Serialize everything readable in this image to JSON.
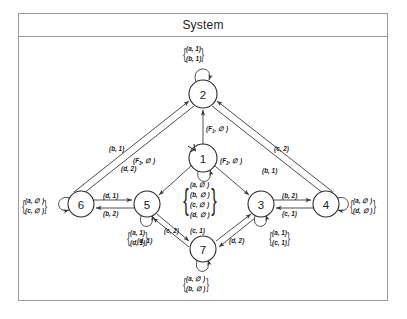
{
  "window": {
    "title": "System"
  },
  "diagram": {
    "type": "state-transition-diagram",
    "nodes": [
      {
        "id": "1",
        "label": "1",
        "x": 203,
        "y": 158,
        "r": 14,
        "initial": true
      },
      {
        "id": "2",
        "label": "2",
        "x": 203,
        "y": 94,
        "r": 14,
        "initial": false
      },
      {
        "id": "3",
        "label": "3",
        "x": 261,
        "y": 204,
        "r": 13,
        "initial": false
      },
      {
        "id": "4",
        "label": "4",
        "x": 326,
        "y": 204,
        "r": 13,
        "initial": false
      },
      {
        "id": "5",
        "label": "5",
        "x": 147,
        "y": 204,
        "r": 13,
        "initial": false
      },
      {
        "id": "6",
        "label": "6",
        "x": 81,
        "y": 204,
        "r": 13,
        "initial": false
      },
      {
        "id": "7",
        "label": "7",
        "x": 203,
        "y": 249,
        "r": 13,
        "initial": false
      }
    ],
    "self_loops": [
      {
        "node": "2",
        "labels": [
          "(a, 1)",
          "(b, 1)"
        ],
        "position": "top"
      },
      {
        "node": "1",
        "labels": [
          "(a, ∅ )",
          "(b, ∅ )",
          "(c, ∅ )",
          "(d, ∅ )"
        ],
        "position": "bottom"
      },
      {
        "node": "6",
        "labels": [
          "(a, ∅ )",
          "(c, ∅ )"
        ],
        "position": "left"
      },
      {
        "node": "5",
        "labels": [
          "(a, 1)",
          "(d, 1)"
        ],
        "position": "bottom"
      },
      {
        "node": "3",
        "labels": [
          "(a, 1)",
          "(c, 1)"
        ],
        "position": "bottom"
      },
      {
        "node": "4",
        "labels": [
          "(a, ∅ )",
          "(d, ∅ )"
        ],
        "position": "right"
      },
      {
        "node": "7",
        "labels": [
          "(a, ∅ )",
          "(b, ∅ )"
        ],
        "position": "bottom"
      }
    ],
    "edges": [
      {
        "from": "1",
        "to": "2",
        "label": "(F",
        "sub": "1",
        "label_tail": ", ∅ )"
      },
      {
        "from": "1",
        "to": "5",
        "label": "(F",
        "sub": "3",
        "label_tail": ", ∅ )"
      },
      {
        "from": "1",
        "to": "3",
        "label": "(F",
        "sub": "2",
        "label_tail": ", ∅ )"
      },
      {
        "from": "6",
        "to": "2",
        "label": "(b, 1)"
      },
      {
        "from": "2",
        "to": "6",
        "label": "(d, 2)"
      },
      {
        "from": "4",
        "to": "2",
        "label": "(c, 2)"
      },
      {
        "from": "2",
        "to": "4",
        "label": "(b, 1)"
      },
      {
        "from": "6",
        "to": "5",
        "label": "(d, 1)"
      },
      {
        "from": "5",
        "to": "6",
        "label": "(b, 2)"
      },
      {
        "from": "3",
        "to": "4",
        "label": "(b, 2)"
      },
      {
        "from": "4",
        "to": "3",
        "label": "(c, 1)"
      },
      {
        "from": "5",
        "to": "7",
        "label": "(c, 2)"
      },
      {
        "from": "7",
        "to": "5",
        "label": "(d, 1)"
      },
      {
        "from": "7",
        "to": "3",
        "label": "(c, 1)"
      },
      {
        "from": "3",
        "to": "7",
        "label": "(d, 2)"
      }
    ]
  },
  "labels": {
    "loop2": {
      "l1": "(a, 1)",
      "l2": "(b, 1)"
    },
    "loop1": {
      "l1": "(a, ∅ )",
      "l2": "(b, ∅ )",
      "l3": "(c, ∅ )",
      "l4": "(d, ∅ )"
    },
    "loop6": {
      "l1": "(a, ∅ )",
      "l2": "(c, ∅ )"
    },
    "loop5": {
      "l1": "(a, 1)",
      "l2": "(d, 1)"
    },
    "loop3": {
      "l1": "(a, 1)",
      "l2": "(c, 1)"
    },
    "loop4": {
      "l1": "(a, ∅ )",
      "l2": "(d, ∅ )"
    },
    "loop7": {
      "l1": "(a, ∅ )",
      "l2": "(b, ∅ )"
    },
    "e_6_2": "(b, 1)",
    "e_2_6": "(d, 2)",
    "e_4_2": "(c, 2)",
    "e_2_4": "(b, 1)",
    "e_6_5": "(d, 1)",
    "e_5_6": "(b, 2)",
    "e_3_4": "(b, 2)",
    "e_4_3": "(c, 1)",
    "e_5_7": "(c, 2)",
    "e_7_5": "(d, 1)",
    "e_7_3": "(c, 1)",
    "e_3_7": "(d, 2)",
    "f_open": "(F",
    "f1_sub": "1",
    "f2_sub": "2",
    "f3_sub": "3",
    "f_close": ", ∅ )"
  }
}
